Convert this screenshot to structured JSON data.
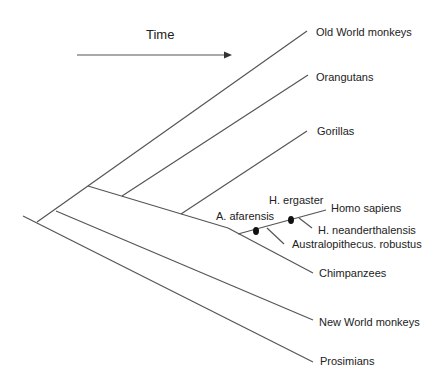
{
  "diagram": {
    "type": "phylogenetic-tree",
    "time_label": "Time",
    "colors": {
      "line": "#555555",
      "text": "#222222",
      "dot": "#111111"
    },
    "taxa": [
      {
        "id": "old-world-monkeys",
        "label": "Old World monkeys"
      },
      {
        "id": "orangutans",
        "label": "Orangutans"
      },
      {
        "id": "gorillas",
        "label": "Gorillas"
      },
      {
        "id": "homo-sapiens",
        "label": "Homo sapiens"
      },
      {
        "id": "h-neanderthalensis",
        "label": "H. neanderthalensis"
      },
      {
        "id": "australopithecus-robustus",
        "label": "Australopithecus. robustus"
      },
      {
        "id": "chimpanzees",
        "label": "Chimpanzees"
      },
      {
        "id": "new-world-monkeys",
        "label": "New World monkeys"
      },
      {
        "id": "prosimians",
        "label": "Prosimians"
      }
    ],
    "ancestors": [
      {
        "id": "a-afarensis",
        "label": "A. afarensis"
      },
      {
        "id": "h-ergaster",
        "label": "H. ergaster"
      }
    ]
  }
}
